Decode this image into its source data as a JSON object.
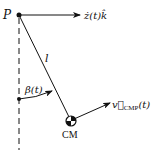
{
  "diagram": {
    "type": "pendulum-kinematics",
    "pivot": {
      "label": "P"
    },
    "pivot_velocity": {
      "label_main": "ż(t)",
      "label_unit": "k̂"
    },
    "rod": {
      "label": "l"
    },
    "angle": {
      "label": "β(t)"
    },
    "center_of_mass": {
      "label": "CM"
    },
    "cm_velocity": {
      "label_main": "v⃗",
      "label_sub": "CMP",
      "label_arg": "(t)"
    },
    "colors": {
      "ink": "#111111",
      "background": "#ffffff"
    }
  }
}
